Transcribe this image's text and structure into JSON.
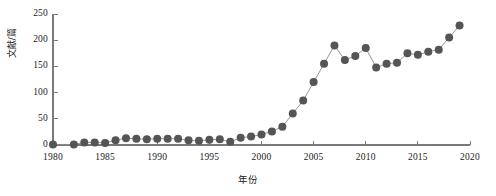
{
  "chart_data": {
    "type": "line",
    "title": "",
    "subtitle": "",
    "xlabel": "年份",
    "ylabel": "文献/篇",
    "xlim": [
      1980,
      2020
    ],
    "ylim": [
      0,
      250
    ],
    "xticks": [
      1980,
      1985,
      1990,
      1995,
      2000,
      2005,
      2010,
      2015,
      2020
    ],
    "xticklabels": [
      "1980",
      "1985",
      "1990",
      "1995",
      "2000",
      "2005",
      "2010",
      "2015",
      "2020"
    ],
    "yticks": [
      0,
      50,
      100,
      150,
      200,
      250
    ],
    "yticklabels": [
      "0",
      "50",
      "100",
      "150",
      "200",
      "250"
    ],
    "grid": false,
    "legend": false,
    "legend_position": "none",
    "marker": "circle",
    "marker_color": "#555555",
    "line_color": "#8a8a8a",
    "axis_color": "#7a7a7a",
    "x": [
      1980,
      1982,
      1983,
      1984,
      1985,
      1986,
      1987,
      1988,
      1989,
      1990,
      1991,
      1992,
      1993,
      1994,
      1995,
      1996,
      1997,
      1998,
      1999,
      2000,
      2001,
      2002,
      2003,
      2004,
      2005,
      2006,
      2007,
      2008,
      2009,
      2010,
      2011,
      2012,
      2013,
      2014,
      2015,
      2016,
      2017,
      2018,
      2019
    ],
    "y": [
      1,
      1,
      5,
      5,
      4,
      9,
      13,
      12,
      11,
      12,
      12,
      12,
      9,
      8,
      10,
      11,
      6,
      14,
      16,
      20,
      26,
      35,
      60,
      85,
      120,
      155,
      190,
      162,
      170,
      185,
      148,
      155,
      157,
      175,
      172,
      178,
      182,
      205,
      228
    ],
    "series": [
      {
        "name": "文献/篇",
        "values": [
          1,
          1,
          5,
          5,
          4,
          9,
          13,
          12,
          11,
          12,
          12,
          12,
          9,
          8,
          10,
          11,
          6,
          14,
          16,
          20,
          26,
          35,
          60,
          85,
          120,
          155,
          190,
          162,
          170,
          185,
          148,
          155,
          157,
          175,
          172,
          178,
          182,
          205,
          228
        ]
      }
    ]
  }
}
